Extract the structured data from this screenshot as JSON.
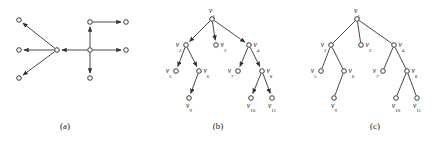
{
  "figure": {
    "background_color": "#ffffff",
    "line_color": "#333333",
    "node_fill_color": "#ffffff",
    "node_stroke_color": "#262626",
    "label_color": "#1a1a1a",
    "panel_count": 3
  },
  "captions": {
    "a": "(a)",
    "b": "(b)",
    "c": "(c)"
  },
  "chart_data": {
    "type": "diagram",
    "panels": [
      {
        "id": "a",
        "caption": "(a)",
        "kind": "directed-graph",
        "arrows": true,
        "labels_shown": false,
        "components": 2,
        "nodes": [
          {
            "id": "a1",
            "x": 19,
            "y": 20,
            "label": ""
          },
          {
            "id": "a2",
            "x": 19,
            "y": 50,
            "label": ""
          },
          {
            "id": "a3",
            "x": 19,
            "y": 78,
            "label": ""
          },
          {
            "id": "a4",
            "x": 57,
            "y": 50,
            "label": ""
          },
          {
            "id": "a5",
            "x": 90,
            "y": 50,
            "label": ""
          },
          {
            "id": "a6",
            "x": 90,
            "y": 22,
            "label": ""
          },
          {
            "id": "a7",
            "x": 90,
            "y": 78,
            "label": ""
          },
          {
            "id": "a8",
            "x": 126,
            "y": 22,
            "label": ""
          },
          {
            "id": "a9",
            "x": 126,
            "y": 50,
            "label": ""
          }
        ],
        "edges": [
          {
            "from": "a4",
            "to": "a1",
            "directed": true
          },
          {
            "from": "a4",
            "to": "a2",
            "directed": true
          },
          {
            "from": "a4",
            "to": "a3",
            "directed": true
          },
          {
            "from": "a5",
            "to": "a4",
            "directed": true
          },
          {
            "from": "a5",
            "to": "a6",
            "directed": true
          },
          {
            "from": "a5",
            "to": "a7",
            "directed": true
          },
          {
            "from": "a5",
            "to": "a9",
            "directed": true
          },
          {
            "from": "a6",
            "to": "a8",
            "directed": true
          }
        ]
      },
      {
        "id": "b",
        "caption": "(b)",
        "kind": "rooted-tree-directed",
        "arrows": true,
        "labels_shown": true,
        "root": "v1",
        "nodes": [
          {
            "id": "v1",
            "x": 62,
            "y": 19,
            "label": "v",
            "sub": "1",
            "label_pos": "above"
          },
          {
            "id": "v2",
            "x": 36,
            "y": 45,
            "label": "v",
            "sub": "2",
            "label_pos": "left"
          },
          {
            "id": "v3",
            "x": 66,
            "y": 45,
            "label": "v",
            "sub": "3",
            "label_pos": "right"
          },
          {
            "id": "v4",
            "x": 99,
            "y": 45,
            "label": "v",
            "sub": "4",
            "label_pos": "right"
          },
          {
            "id": "v5",
            "x": 26,
            "y": 71,
            "label": "v",
            "sub": "5",
            "label_pos": "left"
          },
          {
            "id": "v6",
            "x": 49,
            "y": 71,
            "label": "v",
            "sub": "6",
            "label_pos": "right"
          },
          {
            "id": "v7",
            "x": 88,
            "y": 71,
            "label": "v",
            "sub": "7",
            "label_pos": "left"
          },
          {
            "id": "v8",
            "x": 112,
            "y": 71,
            "label": "v",
            "sub": "8",
            "label_pos": "right"
          },
          {
            "id": "v9",
            "x": 39,
            "y": 98,
            "label": "v",
            "sub": "9",
            "label_pos": "below"
          },
          {
            "id": "v10",
            "x": 101,
            "y": 98,
            "label": "v",
            "sub": "10",
            "label_pos": "below"
          },
          {
            "id": "v11",
            "x": 122,
            "y": 98,
            "label": "v",
            "sub": "11",
            "label_pos": "below"
          }
        ],
        "edges": [
          {
            "from": "v1",
            "to": "v2",
            "directed": true
          },
          {
            "from": "v1",
            "to": "v3",
            "directed": true
          },
          {
            "from": "v1",
            "to": "v4",
            "directed": true
          },
          {
            "from": "v2",
            "to": "v5",
            "directed": true
          },
          {
            "from": "v2",
            "to": "v6",
            "directed": true
          },
          {
            "from": "v4",
            "to": "v7",
            "directed": true
          },
          {
            "from": "v4",
            "to": "v8",
            "directed": true
          },
          {
            "from": "v6",
            "to": "v9",
            "directed": true
          },
          {
            "from": "v8",
            "to": "v10",
            "directed": true
          },
          {
            "from": "v8",
            "to": "v11",
            "directed": true
          }
        ]
      },
      {
        "id": "c",
        "caption": "(c)",
        "kind": "rooted-tree-undirected",
        "arrows": false,
        "labels_shown": true,
        "root": "v1",
        "nodes": [
          {
            "id": "v1",
            "x": 62,
            "y": 19,
            "label": "v",
            "sub": "1",
            "label_pos": "above"
          },
          {
            "id": "v2",
            "x": 36,
            "y": 45,
            "label": "v",
            "sub": "2",
            "label_pos": "left"
          },
          {
            "id": "v3",
            "x": 66,
            "y": 45,
            "label": "v",
            "sub": "3",
            "label_pos": "right"
          },
          {
            "id": "v4",
            "x": 99,
            "y": 45,
            "label": "v",
            "sub": "4",
            "label_pos": "right"
          },
          {
            "id": "v5",
            "x": 26,
            "y": 71,
            "label": "v",
            "sub": "5",
            "label_pos": "left"
          },
          {
            "id": "v6",
            "x": 49,
            "y": 71,
            "label": "v",
            "sub": "6",
            "label_pos": "right"
          },
          {
            "id": "v7",
            "x": 88,
            "y": 71,
            "label": "v",
            "sub": "7",
            "label_pos": "left"
          },
          {
            "id": "v8",
            "x": 112,
            "y": 71,
            "label": "v",
            "sub": "8",
            "label_pos": "right"
          },
          {
            "id": "v9",
            "x": 39,
            "y": 98,
            "label": "v",
            "sub": "9",
            "label_pos": "below"
          },
          {
            "id": "v10",
            "x": 101,
            "y": 98,
            "label": "v",
            "sub": "10",
            "label_pos": "below"
          },
          {
            "id": "v11",
            "x": 122,
            "y": 98,
            "label": "v",
            "sub": "11",
            "label_pos": "below"
          }
        ],
        "edges": [
          {
            "from": "v1",
            "to": "v2",
            "directed": false
          },
          {
            "from": "v1",
            "to": "v3",
            "directed": false
          },
          {
            "from": "v1",
            "to": "v4",
            "directed": false
          },
          {
            "from": "v2",
            "to": "v5",
            "directed": false
          },
          {
            "from": "v2",
            "to": "v6",
            "directed": false
          },
          {
            "from": "v4",
            "to": "v7",
            "directed": false
          },
          {
            "from": "v4",
            "to": "v8",
            "directed": false
          },
          {
            "from": "v6",
            "to": "v9",
            "directed": false
          },
          {
            "from": "v8",
            "to": "v10",
            "directed": false
          },
          {
            "from": "v8",
            "to": "v11",
            "directed": false
          }
        ]
      }
    ]
  }
}
